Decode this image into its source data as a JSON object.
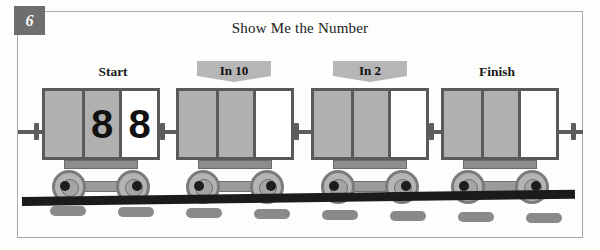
{
  "worksheet": {
    "problem_number": "6",
    "title": "Show Me the Number"
  },
  "labels": {
    "start": "Start",
    "in10": "In 10",
    "in2": "In 2",
    "finish": "Finish"
  },
  "colors": {
    "badge_bg": "#6e6e6e",
    "banner_bg": "#b6b6b6",
    "panel_gray": "#b0b0b0",
    "panel_white": "#ffffff",
    "car_outline": "#5a5a5a",
    "rail": "#1b1b1b",
    "tie": "#8a8a8a",
    "frame_border": "#a9a9a9"
  },
  "cars": [
    {
      "name": "start-car",
      "label": "Start",
      "label_type": "plain",
      "panels": [
        {
          "fill": "gray",
          "digit": ""
        },
        {
          "fill": "gray",
          "digit": "8"
        },
        {
          "fill": "white",
          "digit": "8"
        }
      ]
    },
    {
      "name": "in10-car",
      "label": "In 10",
      "label_type": "banner",
      "panels": [
        {
          "fill": "gray",
          "digit": ""
        },
        {
          "fill": "gray",
          "digit": ""
        },
        {
          "fill": "white",
          "digit": ""
        }
      ]
    },
    {
      "name": "in2-car",
      "label": "In 2",
      "label_type": "banner",
      "panels": [
        {
          "fill": "gray",
          "digit": ""
        },
        {
          "fill": "gray",
          "digit": ""
        },
        {
          "fill": "white",
          "digit": ""
        }
      ]
    },
    {
      "name": "finish-car",
      "label": "Finish",
      "label_type": "plain",
      "panels": [
        {
          "fill": "gray",
          "digit": ""
        },
        {
          "fill": "gray",
          "digit": ""
        },
        {
          "fill": "white",
          "digit": ""
        }
      ]
    }
  ],
  "track": {
    "tie_count": 8
  }
}
